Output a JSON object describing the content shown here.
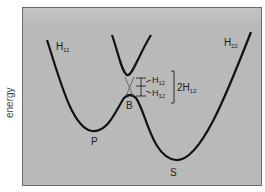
{
  "diagram": {
    "y_axis_label": "energy",
    "curves": {
      "reactant_label": "H",
      "reactant_sub": "11",
      "product_label": "H",
      "product_sub": "22"
    },
    "points": {
      "reactant_min": "P",
      "product_min": "S",
      "barrier": "B"
    },
    "coupling": {
      "upper_label": "H",
      "upper_sub": "12",
      "lower_label": "H",
      "lower_sub": "12",
      "gap_label": "2H",
      "gap_sub": "12"
    },
    "colors": {
      "background": "#b9b9b9",
      "curve": "#111111",
      "diabatic": "#555555"
    }
  }
}
